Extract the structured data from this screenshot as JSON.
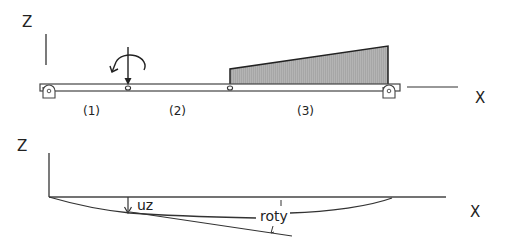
{
  "top_diagram": {
    "axis_z_label": "Z",
    "axis_x_label": "X",
    "segments": [
      {
        "id": 1,
        "label": "(1)"
      },
      {
        "id": 2,
        "label": "(2)"
      },
      {
        "id": 3,
        "label": "(3)"
      }
    ],
    "loads": {
      "point_force": "downward force at hinge between segments 1 and 2",
      "moment": "counter-clockwise moment at same location",
      "distributed": "linearly increasing load over segment 3"
    },
    "supports": [
      "left-pin-support",
      "right-pin-support"
    ],
    "colors": {
      "line": "#333333",
      "load_fill": "#a8a8a8",
      "beam_fill": "#ffffff"
    }
  },
  "bottom_diagram": {
    "axis_z_label": "Z",
    "axis_x_label": "X",
    "displacement_label": "uz",
    "rotation_label": "roty"
  }
}
